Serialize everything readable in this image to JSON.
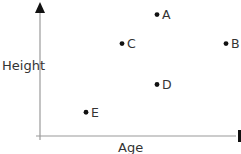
{
  "chart_data": {
    "type": "scatter",
    "title": "",
    "xlabel": "Age",
    "ylabel": "Height",
    "grid": false,
    "ticks": false,
    "note": "No tick marks or numeric labels appear in the chart. Point coordinates are estimated from pixel positions on an arbitrary 0-10 relative scale.",
    "xlim": [
      0,
      10
    ],
    "ylim": [
      0,
      10
    ],
    "points": [
      {
        "label": "A",
        "x": 5.85,
        "y": 9.2
      },
      {
        "label": "B",
        "x": 9.3,
        "y": 7.0
      },
      {
        "label": "C",
        "x": 4.1,
        "y": 7.0
      },
      {
        "label": "D",
        "x": 5.85,
        "y": 3.9
      },
      {
        "label": "E",
        "x": 2.3,
        "y": 1.8
      }
    ]
  },
  "colors": {
    "axis": "#9a9a9a",
    "arrow": "#111111",
    "point": "#111111",
    "text": "#333333"
  }
}
